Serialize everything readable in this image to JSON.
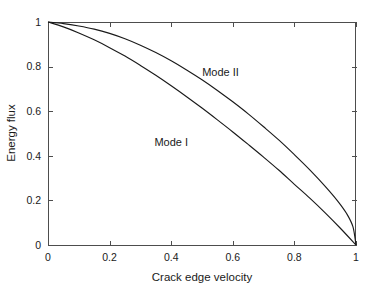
{
  "chart_data": {
    "type": "line",
    "title": "",
    "subtitle": "",
    "xlabel": "Crack edge velocity",
    "ylabel": "Energy flux",
    "xlim": [
      0,
      1
    ],
    "ylim": [
      0,
      1
    ],
    "xticks": [
      0,
      0.2,
      0.4,
      0.6,
      0.8,
      1
    ],
    "yticks": [
      0,
      0.2,
      0.4,
      0.6,
      0.8,
      1
    ],
    "xticklabels": [
      "0",
      "0.2",
      "0.4",
      "0.6",
      "0.8",
      "1"
    ],
    "yticklabels": [
      "0",
      "0.2",
      "0.4",
      "0.6",
      "0.8",
      "1"
    ],
    "grid": false,
    "legend_position": "inline-annotations",
    "series": [
      {
        "name": "Mode II",
        "label_text": "Mode II",
        "label_x": 0.56,
        "label_y": 0.76,
        "color": "#1a1a1a",
        "x": [
          0,
          0.05,
          0.1,
          0.15,
          0.2,
          0.25,
          0.3,
          0.35,
          0.4,
          0.45,
          0.5,
          0.55,
          0.6,
          0.65,
          0.7,
          0.75,
          0.8,
          0.85,
          0.9,
          0.94,
          0.97,
          0.99,
          1
        ],
        "values": [
          1,
          0.993,
          0.982,
          0.968,
          0.949,
          0.925,
          0.896,
          0.863,
          0.826,
          0.785,
          0.741,
          0.693,
          0.642,
          0.588,
          0.53,
          0.47,
          0.405,
          0.337,
          0.263,
          0.198,
          0.14,
          0.082,
          0
        ]
      },
      {
        "name": "Mode I",
        "label_text": "Mode I",
        "label_x": 0.4,
        "label_y": 0.445,
        "color": "#1a1a1a",
        "x": [
          0,
          0.05,
          0.1,
          0.15,
          0.2,
          0.25,
          0.3,
          0.35,
          0.4,
          0.45,
          0.5,
          0.55,
          0.6,
          0.65,
          0.7,
          0.75,
          0.8,
          0.85,
          0.9,
          0.95,
          1
        ],
        "values": [
          1,
          0.978,
          0.951,
          0.92,
          0.885,
          0.847,
          0.805,
          0.761,
          0.714,
          0.665,
          0.614,
          0.561,
          0.507,
          0.451,
          0.394,
          0.335,
          0.272,
          0.21,
          0.144,
          0.074,
          0
        ]
      }
    ]
  },
  "axes": {
    "left_px": 48,
    "right_px": 356,
    "top_px": 22,
    "bottom_px": 245
  },
  "colors": {
    "background": "#ffffff",
    "frame": "#4d4d4d",
    "curve": "#1a1a1a",
    "text": "#1a1a1a"
  }
}
